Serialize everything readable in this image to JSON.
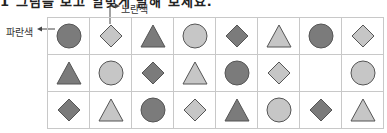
{
  "header": {
    "cutoff_text": "1 그림을 보고 알맞게 말해 보세요."
  },
  "annotations": [
    {
      "label": "노란색",
      "target": "row1-col2",
      "direction": "up-right"
    },
    {
      "label": "파란색",
      "target": "row1-col1",
      "direction": "left"
    }
  ],
  "colors": {
    "dark": "#7b7b7b",
    "light": "#c6c6c6",
    "stroke": "#555555",
    "grid": "#c8c8c8"
  },
  "grid": {
    "rows": [
      [
        "circle-dark",
        "diamond-light",
        "triangle-dark",
        "circle-light",
        "diamond-dark",
        "triangle-light",
        "circle-dark",
        "diamond-light"
      ],
      [
        "triangle-dark",
        "circle-light",
        "diamond-dark",
        "triangle-light",
        "circle-dark",
        "diamond-light",
        "empty",
        "circle-light"
      ],
      [
        "diamond-dark",
        "triangle-light",
        "circle-dark",
        "diamond-light",
        "triangle-dark",
        "circle-light",
        "diamond-dark",
        "triangle-light"
      ]
    ]
  }
}
